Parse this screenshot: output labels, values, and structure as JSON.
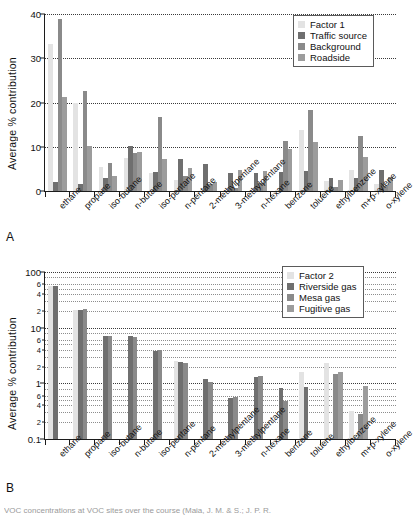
{
  "figure": {
    "panel_a_letter": "A",
    "panel_b_letter": "B",
    "caption": "VOC concentrations at VOC sites over the course (Maia, J. M. & S.; J. P. R."
  },
  "colors": {
    "factor": "#e3e3e3",
    "series2": "#6f6f6f",
    "series3": "#8a8a8a",
    "series4": "#9c9c9c",
    "axis": "#1c1c1c",
    "grid": "#3a3a3a",
    "background": "#ffffff"
  },
  "chart_data": [
    {
      "type": "bar",
      "panel": "A",
      "title": "",
      "xlabel": "",
      "ylabel": "Average % contribution",
      "yscale": "linear",
      "ylim": [
        0,
        40
      ],
      "yticks": [
        0,
        10,
        20,
        30,
        40
      ],
      "ytick_labels": [
        "0",
        "10",
        "20",
        "30",
        "40"
      ],
      "grid": true,
      "legend_position": "top-right",
      "legend": [
        "Factor 1",
        "Traffic source",
        "Background",
        "Roadside"
      ],
      "categories": [
        "ethane",
        "propane",
        "iso-butane",
        "n-butane",
        "iso-pentane",
        "n-pentane",
        "2-methylpentane",
        "3-methylpentane",
        "n-hexane",
        "benzene",
        "toluene",
        "ethylbenzene",
        "m+p-xylene",
        "o-xylene"
      ],
      "series": [
        {
          "name": "Factor 1",
          "values": [
            33.2,
            20.0,
            5.5,
            7.4,
            4.0,
            2.6,
            0.0,
            0.0,
            0.0,
            0.0,
            13.8,
            2.3,
            4.8,
            1.6
          ]
        },
        {
          "name": "Traffic source",
          "values": [
            2.1,
            1.6,
            3.0,
            10.1,
            4.3,
            7.3,
            6.2,
            4.0,
            4.1,
            4.2,
            4.5,
            3.0,
            3.0,
            4.8
          ]
        },
        {
          "name": "Background",
          "values": [
            38.9,
            22.7,
            6.4,
            8.7,
            16.8,
            3.5,
            1.5,
            0.6,
            1.9,
            11.2,
            18.3,
            1.0,
            12.4,
            1.1
          ]
        },
        {
          "name": "Roadside",
          "values": [
            21.2,
            10.1,
            3.5,
            8.8,
            7.3,
            5.1,
            2.1,
            4.7,
            4.5,
            9.6,
            11.0,
            2.4,
            7.8,
            3.2
          ]
        }
      ]
    },
    {
      "type": "bar",
      "panel": "B",
      "title": "",
      "xlabel": "",
      "ylabel": "Average % contribution",
      "yscale": "log",
      "ylim": [
        0.1,
        100
      ],
      "yticks": [
        0.1,
        0.2,
        0.4,
        0.6,
        1,
        2,
        4,
        6,
        10,
        20,
        40,
        60,
        100
      ],
      "ytick_labels": [
        "0.1",
        "2",
        "4",
        "6",
        "1",
        "2",
        "4",
        "6",
        "10",
        "2",
        "4",
        "6",
        "100"
      ],
      "major_ticks": [
        0.1,
        1,
        10,
        100
      ],
      "grid": true,
      "legend_position": "top-right",
      "legend": [
        "Factor 2",
        "Riverside gas",
        "Mesa gas",
        "Fugitive gas"
      ],
      "categories": [
        "ethane",
        "propane",
        "iso-butane",
        "n-butane",
        "iso-pentane",
        "n-pentane",
        "2-methylpentane",
        "3-methylpentane",
        "n-hexane",
        "benzene",
        "toluene",
        "ethylbenzene",
        "m+p-xylene",
        "o-xylene"
      ],
      "series": [
        {
          "name": "Factor 2",
          "values": [
            55.0,
            21.0,
            0,
            0,
            0,
            2.5,
            0,
            0,
            0,
            0,
            1.6,
            2.3,
            0.32,
            0
          ]
        },
        {
          "name": "Riverside gas",
          "values": [
            55.0,
            21.0,
            7.0,
            7.0,
            3.8,
            2.4,
            1.2,
            0.55,
            1.3,
            0.82,
            0.85,
            0,
            0,
            0
          ]
        },
        {
          "name": "Mesa gas",
          "values": [
            0,
            21.5,
            7.0,
            6.8,
            3.9,
            2.3,
            1.05,
            0.58,
            1.35,
            0.48,
            0,
            1.5,
            0.28,
            0
          ]
        },
        {
          "name": "Fugitive gas",
          "values": [
            0,
            0,
            0,
            0,
            0,
            0,
            0,
            0,
            0,
            0,
            0,
            1.6,
            0.9,
            0
          ]
        }
      ]
    }
  ]
}
